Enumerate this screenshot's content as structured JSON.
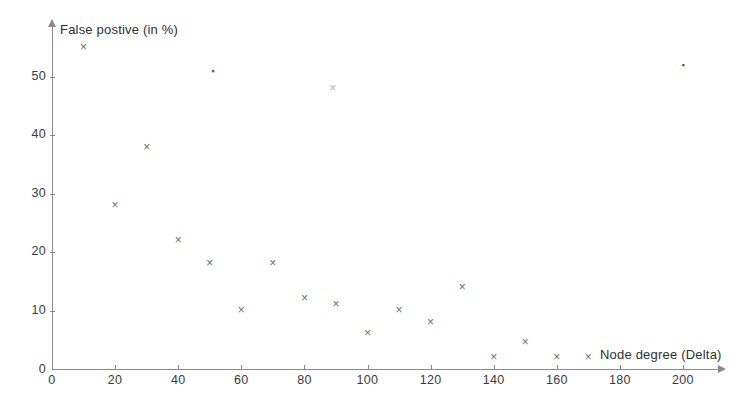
{
  "chart_data": {
    "type": "scatter",
    "title": "",
    "xlabel": "Node degree (Delta)",
    "ylabel": "False postive (in %)",
    "xlim": [
      0,
      212
    ],
    "ylim": [
      0,
      58
    ],
    "xticks": [
      0,
      20,
      40,
      60,
      80,
      100,
      120,
      140,
      160,
      180,
      200
    ],
    "yticks": [
      0,
      10,
      20,
      30,
      40,
      50
    ],
    "grid": false,
    "legend": null,
    "marker": "x",
    "series": [
      {
        "name": "False positive rate",
        "points": [
          {
            "x": 10,
            "y": 55
          },
          {
            "x": 20,
            "y": 28
          },
          {
            "x": 30,
            "y": 38
          },
          {
            "x": 40,
            "y": 22
          },
          {
            "x": 50,
            "y": 18
          },
          {
            "x": 51,
            "y": 51
          },
          {
            "x": 60,
            "y": 10
          },
          {
            "x": 70,
            "y": 18
          },
          {
            "x": 80,
            "y": 12
          },
          {
            "x": 89,
            "y": 48
          },
          {
            "x": 90,
            "y": 11
          },
          {
            "x": 100,
            "y": 6
          },
          {
            "x": 110,
            "y": 10
          },
          {
            "x": 120,
            "y": 8
          },
          {
            "x": 130,
            "y": 14
          },
          {
            "x": 140,
            "y": 2
          },
          {
            "x": 150,
            "y": 4.5
          },
          {
            "x": 160,
            "y": 2
          },
          {
            "x": 170,
            "y": 2
          },
          {
            "x": 200,
            "y": 52
          }
        ]
      }
    ]
  },
  "axes": {
    "x_title": "Node degree (Delta)",
    "y_title": "False postive (in %)",
    "x_tick_labels": [
      "0",
      "20",
      "40",
      "60",
      "80",
      "100",
      "120",
      "140",
      "160",
      "180",
      "200"
    ],
    "y_tick_labels": [
      "0",
      "10",
      "20",
      "30",
      "40",
      "50"
    ],
    "origin_label": "0"
  },
  "colors": {
    "axis": "#8a8a8a",
    "marker": "#6e6e6e",
    "text": "#2f2f2f",
    "background": "#ffffff"
  }
}
